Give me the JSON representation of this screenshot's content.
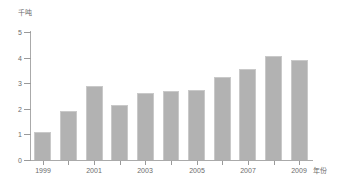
{
  "chart_data": {
    "type": "bar",
    "title": "",
    "subtitle": "",
    "xlabel": "年份",
    "ylabel": "千吨",
    "categories": [
      "1999",
      "2000",
      "2001",
      "2002",
      "2003",
      "2004",
      "2005",
      "2006",
      "2007",
      "2008",
      "2009"
    ],
    "values": [
      1.1,
      1.9,
      2.9,
      2.15,
      2.6,
      2.7,
      2.75,
      3.25,
      3.55,
      4.05,
      3.9
    ],
    "series": [
      {
        "name": "",
        "values": [
          1.1,
          1.9,
          2.9,
          2.15,
          2.6,
          2.7,
          2.75,
          3.25,
          3.55,
          4.05,
          3.9
        ]
      }
    ],
    "ylim": [
      0,
      5
    ],
    "ytick_labels": [
      "0",
      "1",
      "2",
      "3",
      "4",
      "5"
    ],
    "ytick_values": [
      0,
      1,
      2,
      3,
      4,
      5
    ],
    "xtick_labels": [
      "1999",
      "2001",
      "2003",
      "2005",
      "2007",
      "2009"
    ],
    "xtick_values": [
      "1999",
      "2001",
      "2003",
      "2005",
      "2007",
      "2009"
    ],
    "grid": false,
    "legend": false,
    "legend_position": "none",
    "bar_color": "#b2b2b2",
    "bar_border_color": "#c9c9c9",
    "axis_color": "#aaaaaa",
    "text_color": "#6b6b6b",
    "background_color": "#ffffff"
  }
}
